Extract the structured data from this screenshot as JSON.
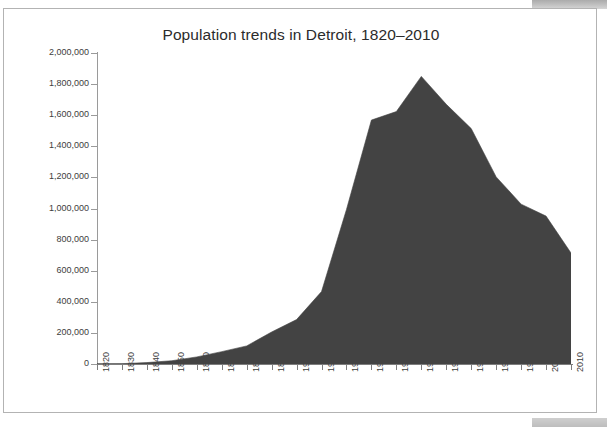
{
  "window": {
    "chrome_top_name": "window-chrome-top",
    "chrome_bottom_name": "window-chrome-bottom"
  },
  "chart_data": {
    "type": "area",
    "title": "Population trends in Detroit, 1820–2010",
    "xlabel": "",
    "ylabel": "",
    "ylim": [
      0,
      2000000
    ],
    "xlim": [
      1820,
      2010
    ],
    "grid": false,
    "legend": null,
    "series_color": "#434343",
    "categories": [
      "1820",
      "1830",
      "1840",
      "1850",
      "1860",
      "1870",
      "1880",
      "1890",
      "1900",
      "1910",
      "1920",
      "1930",
      "1940",
      "1950",
      "1960",
      "1970",
      "1980",
      "1990",
      "2000",
      "2010"
    ],
    "values": [
      1422,
      2222,
      9102,
      21019,
      45619,
      79577,
      116340,
      205876,
      285704,
      465766,
      993678,
      1568662,
      1623452,
      1849568,
      1670144,
      1514063,
      1203339,
      1027974,
      951270,
      713777
    ],
    "y_ticks": [
      0,
      200000,
      400000,
      600000,
      800000,
      1000000,
      1200000,
      1400000,
      1600000,
      1800000,
      2000000
    ],
    "y_tick_labels": [
      "0",
      "200,000",
      "400,000",
      "600,000",
      "800,000",
      "1,000,000",
      "1,200,000",
      "1,400,000",
      "1,600,000",
      "1,800,000",
      "2,000,000"
    ],
    "series": [
      {
        "name": "Population",
        "values": [
          1422,
          2222,
          9102,
          21019,
          45619,
          79577,
          116340,
          205876,
          285704,
          465766,
          993678,
          1568662,
          1623452,
          1849568,
          1670144,
          1514063,
          1203339,
          1027974,
          951270,
          713777
        ]
      }
    ]
  }
}
